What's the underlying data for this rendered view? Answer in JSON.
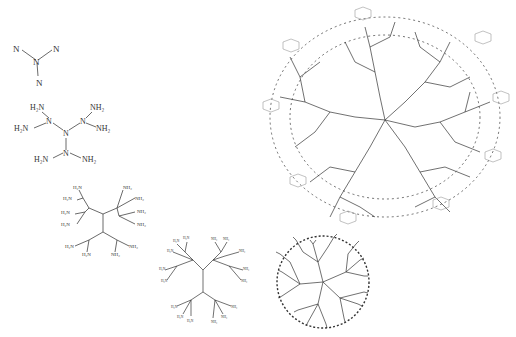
{
  "diagram": {
    "type": "dendrimer-generations",
    "background": "#ffffff",
    "structures": [
      {
        "id": "g0",
        "label": "core",
        "atoms": [
          "N",
          "N",
          "N",
          "N"
        ],
        "center": "N"
      },
      {
        "id": "g1",
        "atoms": {
          "center": "N",
          "branch_n": "N",
          "terminals": [
            "H2N",
            "H2N",
            "NH2",
            "NH2",
            "H2N",
            "NH2"
          ]
        }
      },
      {
        "id": "g2",
        "atoms": {
          "center": "N",
          "terminals": [
            "H2N",
            "H2N",
            "H2N",
            "H2N",
            "NH2",
            "NH2",
            "NH2",
            "NH2",
            "H2N",
            "H2N",
            "NH2",
            "NH2"
          ]
        }
      },
      {
        "id": "g3",
        "description": "third generation dendrimer with NH2 terminals"
      },
      {
        "id": "g4",
        "description": "fourth generation dendrimer skeletal outline"
      },
      {
        "id": "glyco",
        "description": "large glycodendrimer with sugar end groups",
        "sugar_groups": 8
      }
    ],
    "text": {
      "n": "N",
      "h2n": "H₂N",
      "nh2": "NH₂"
    }
  }
}
